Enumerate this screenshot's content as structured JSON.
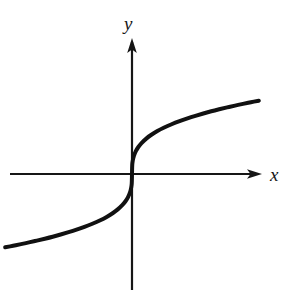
{
  "figure": {
    "background_color": "#ffffff",
    "width": 295,
    "height": 298,
    "axis_color": "#161616",
    "curve_color": "#111111"
  },
  "axes": {
    "x_label": "x",
    "y_label": "y",
    "x_axis_name": "horizontal-axis",
    "y_axis_name": "vertical-axis",
    "x_arrow_icon": "arrow-right-icon",
    "y_arrow_icon": "arrow-up-icon",
    "origin_x": 132,
    "origin_y": 174,
    "x_axis_start_px": 10,
    "x_axis_end_px": 262,
    "y_axis_start_px": 290,
    "y_axis_end_px": 38
  },
  "chart_data": {
    "type": "line",
    "title": "",
    "subtitle": "",
    "xlabel": "x",
    "ylabel": "y",
    "grid": false,
    "legend": null,
    "legend_position": "none",
    "tick_labels_x": [],
    "tick_labels_y": [],
    "xlim": [
      -8.2,
      8.2
    ],
    "ylim": [
      -2.1,
      2.1
    ],
    "annotations": [],
    "series": [
      {
        "name": "y = cube root of x",
        "expression": "y = x^(1/3)",
        "color": "#111111",
        "line_width": 4,
        "x": [
          -8.0,
          -7.5,
          -7.0,
          -6.5,
          -6.0,
          -5.5,
          -5.0,
          -4.5,
          -4.0,
          -3.5,
          -3.0,
          -2.5,
          -2.0,
          -1.6,
          -1.2,
          -0.9,
          -0.6,
          -0.4,
          -0.25,
          -0.12,
          -0.05,
          -0.015,
          0.0,
          0.015,
          0.05,
          0.12,
          0.25,
          0.4,
          0.6,
          0.9,
          1.2,
          1.6,
          2.0,
          2.5,
          3.0,
          3.5,
          4.0,
          4.5,
          5.0,
          5.5,
          6.0,
          6.5,
          7.0,
          7.5,
          8.0
        ],
        "y": [
          -2.0,
          -1.957,
          -1.913,
          -1.866,
          -1.817,
          -1.765,
          -1.71,
          -1.651,
          -1.587,
          -1.518,
          -1.442,
          -1.357,
          -1.26,
          -1.17,
          -1.063,
          -0.965,
          -0.843,
          -0.737,
          -0.63,
          -0.493,
          -0.368,
          -0.247,
          0.0,
          0.247,
          0.368,
          0.493,
          0.63,
          0.737,
          0.843,
          0.965,
          1.063,
          1.17,
          1.26,
          1.357,
          1.442,
          1.518,
          1.587,
          1.651,
          1.71,
          1.765,
          1.817,
          1.866,
          1.913,
          1.957,
          2.0
        ]
      }
    ]
  }
}
